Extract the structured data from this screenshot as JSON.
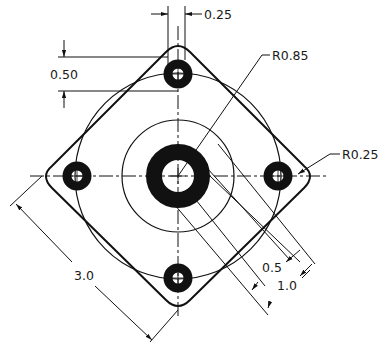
{
  "drawing": {
    "type": "mechanical-plate-drawing",
    "colors": {
      "line": "#111111",
      "background": "#ffffff"
    },
    "dimensions": {
      "hole_width": "0.25",
      "hole_offset": "0.50",
      "bolt_circle_radius": "R0.85",
      "corner_radius": "R0.25",
      "overall_size": "3.0",
      "inner_circle": "0.5",
      "outer_dim": "1.0"
    }
  }
}
